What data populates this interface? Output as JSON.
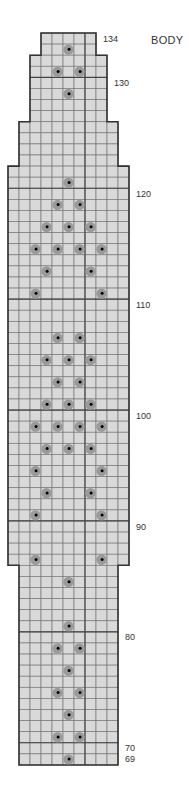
{
  "title": "BODY",
  "grid": {
    "origin_x": 8,
    "top_y": 33,
    "cell_w": 11,
    "cell_h": 11.09,
    "total_cols": 11,
    "top_row": 134,
    "bottom_row": 69,
    "cell_fill": "#d9d9d9",
    "line_color": "#7a7a7a",
    "heavy_line_color": "#444444",
    "outline_color": "#333333",
    "heavy_col_boundary": 7,
    "heavy_row_every": 10
  },
  "width_segments": [
    {
      "from_row": 134,
      "to_row": 133,
      "start_col": 3,
      "end_col": 8
    },
    {
      "from_row": 132,
      "to_row": 127,
      "start_col": 2,
      "end_col": 9
    },
    {
      "from_row": 126,
      "to_row": 123,
      "start_col": 1,
      "end_col": 10
    },
    {
      "from_row": 122,
      "to_row": 87,
      "start_col": 0,
      "end_col": 11
    },
    {
      "from_row": 86,
      "to_row": 69,
      "start_col": 1,
      "end_col": 10
    }
  ],
  "symbol": {
    "name": "bobble-dot",
    "outer_color": "#9a9a9a",
    "inner_color": "#000000"
  },
  "dots": [
    {
      "row": 133,
      "cols": [
        5
      ]
    },
    {
      "row": 131,
      "cols": [
        4,
        6
      ]
    },
    {
      "row": 129,
      "cols": [
        5
      ]
    },
    {
      "row": 121,
      "cols": [
        5
      ]
    },
    {
      "row": 119,
      "cols": [
        4,
        6
      ]
    },
    {
      "row": 117,
      "cols": [
        3,
        5,
        7
      ]
    },
    {
      "row": 115,
      "cols": [
        2,
        4,
        6,
        8
      ]
    },
    {
      "row": 113,
      "cols": [
        3,
        7
      ]
    },
    {
      "row": 111,
      "cols": [
        2,
        8
      ]
    },
    {
      "row": 107,
      "cols": [
        4,
        6
      ]
    },
    {
      "row": 105,
      "cols": [
        3,
        5,
        7
      ]
    },
    {
      "row": 103,
      "cols": [
        4,
        6
      ]
    },
    {
      "row": 101,
      "cols": [
        3,
        5,
        7
      ]
    },
    {
      "row": 99,
      "cols": [
        2,
        4,
        6,
        8
      ]
    },
    {
      "row": 97,
      "cols": [
        3,
        5,
        7
      ]
    },
    {
      "row": 95,
      "cols": [
        2,
        8
      ]
    },
    {
      "row": 93,
      "cols": [
        3,
        7
      ]
    },
    {
      "row": 91,
      "cols": [
        2,
        8
      ]
    },
    {
      "row": 87,
      "cols": [
        2,
        8
      ]
    },
    {
      "row": 85,
      "cols": [
        5
      ]
    },
    {
      "row": 81,
      "cols": [
        5
      ]
    },
    {
      "row": 79,
      "cols": [
        4,
        6
      ]
    },
    {
      "row": 77,
      "cols": [
        5
      ]
    },
    {
      "row": 75,
      "cols": [
        4,
        6
      ]
    },
    {
      "row": 73,
      "cols": [
        5
      ]
    },
    {
      "row": 71,
      "cols": [
        4,
        6
      ]
    },
    {
      "row": 69,
      "cols": [
        5
      ]
    }
  ],
  "row_labels": [
    {
      "text": "134",
      "row": 134,
      "x": 103
    },
    {
      "text": "130",
      "row": 130,
      "x": 114
    },
    {
      "text": "120",
      "row": 120,
      "x": 136
    },
    {
      "text": "110",
      "row": 110,
      "x": 136
    },
    {
      "text": "100",
      "row": 100,
      "x": 136
    },
    {
      "text": "90",
      "row": 90,
      "x": 136
    },
    {
      "text": "80",
      "row": 80,
      "x": 125
    },
    {
      "text": "70",
      "row": 70,
      "x": 125
    },
    {
      "text": "69",
      "row": 69,
      "x": 125
    }
  ]
}
